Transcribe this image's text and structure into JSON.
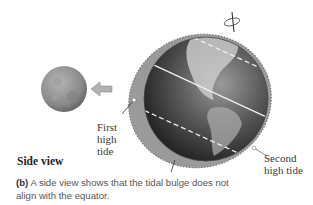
{
  "figure": {
    "panel_label": "(b)",
    "caption_text": " A side view shows that the tidal bulge does not align with the equator.",
    "view_title": "Side view",
    "labels": {
      "first_high_tide": "First high tide",
      "second_high_tide": "Second high tide"
    },
    "elements": {
      "moon": "moon",
      "earth": "earth",
      "tidal_bulge": "tidal-bulge",
      "arrow": "gravity-arrow-toward-moon",
      "rotation_axis": "rotation-axis"
    },
    "colors": {
      "bulge": "#9a9a9a",
      "earth_dark": "#1e1e1e",
      "earth_light": "#8a8a8a",
      "moon": "#8f8f8f",
      "arrow": "#a8a8a8",
      "text": "#3a3a3a"
    }
  }
}
